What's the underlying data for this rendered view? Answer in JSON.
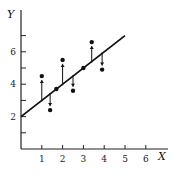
{
  "chart_data": {
    "type": "scatter",
    "title": "",
    "xlabel": "X",
    "ylabel": "Y",
    "xlim": [
      0,
      7
    ],
    "ylim": [
      0,
      7.5
    ],
    "x_ticks": [
      1,
      2,
      3,
      4,
      5,
      6
    ],
    "y_ticks_labeled": [
      2,
      4,
      6
    ],
    "y_ticks_minor": [
      1,
      3,
      5,
      7
    ],
    "grid": false,
    "points": [
      {
        "x": 1.0,
        "y": 4.5,
        "residual_arrow": "up"
      },
      {
        "x": 1.4,
        "y": 2.4,
        "residual_arrow": "down"
      },
      {
        "x": 1.7,
        "y": 3.7,
        "residual_arrow": "none"
      },
      {
        "x": 2.0,
        "y": 5.5,
        "residual_arrow": "up"
      },
      {
        "x": 2.5,
        "y": 3.6,
        "residual_arrow": "down"
      },
      {
        "x": 3.0,
        "y": 5.0,
        "residual_arrow": "none"
      },
      {
        "x": 3.4,
        "y": 6.6,
        "residual_arrow": "up"
      },
      {
        "x": 3.9,
        "y": 4.9,
        "residual_arrow": "down"
      }
    ],
    "fit_line": {
      "x0": 0,
      "y0": 2,
      "x1": 5,
      "y1": 7,
      "slope": 1,
      "intercept": 2
    }
  },
  "labels": {
    "x_axis": "X",
    "y_axis": "Y",
    "x_ticks": [
      "1",
      "2",
      "3",
      "4",
      "5",
      "6"
    ],
    "y_ticks": [
      "2",
      "4",
      "6"
    ]
  }
}
